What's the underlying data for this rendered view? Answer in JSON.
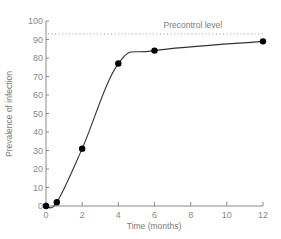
{
  "chart_data": {
    "type": "line",
    "title": "",
    "xlabel": "Time (months)",
    "ylabel": "Prevalence of infection",
    "xlim": [
      0,
      12
    ],
    "ylim": [
      0,
      100
    ],
    "x_ticks": [
      0,
      2,
      4,
      6,
      8,
      10,
      12
    ],
    "y_ticks": [
      0,
      10,
      20,
      30,
      40,
      50,
      60,
      70,
      80,
      90,
      100
    ],
    "grid": false,
    "series": [
      {
        "name": "Prevalence of infection",
        "x": [
          0,
          0.6,
          2,
          4,
          6,
          12
        ],
        "y": [
          0,
          2,
          31,
          77,
          84,
          89
        ],
        "marker": "filled-circle",
        "line": "smooth"
      }
    ],
    "reference_lines": [
      {
        "label": "Precontrol level",
        "y": 93,
        "style": "dotted"
      }
    ],
    "annotations": [
      {
        "text": "Precontrol level",
        "x": 6.5,
        "y": 96
      }
    ]
  },
  "colors": {
    "axis": "#8a8a8a",
    "line": "#333333",
    "marker": "#000000",
    "reference": "#999999"
  }
}
